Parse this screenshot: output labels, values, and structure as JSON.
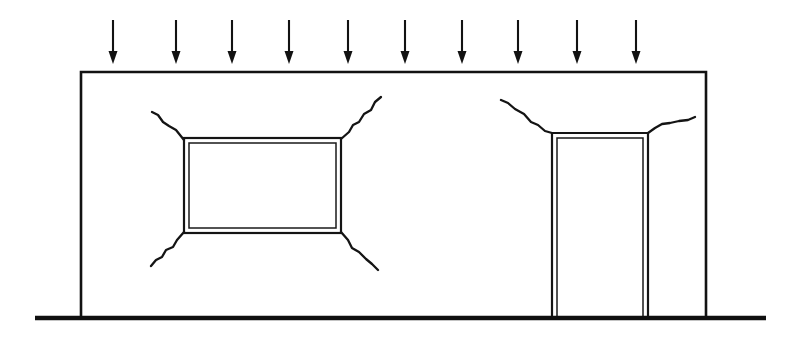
{
  "diagram": {
    "background_color": "#ffffff",
    "line_color": "#121212",
    "canvas": {
      "width": 797,
      "height": 338
    }
  },
  "wall": {
    "label": "Wall panel",
    "x_left": 81,
    "x_right": 706,
    "y_top": 72,
    "y_bottom": 318,
    "stroke_width": 2.6,
    "path": "M 81 318 L 81 72 L 706 72 L 706 318"
  },
  "ground": {
    "label": "Ground / support line",
    "x_start": 35,
    "x_end": 766,
    "y": 318,
    "stroke_width": 4.6
  },
  "load": {
    "label": "Uniform vertical load",
    "arrow_count": 10,
    "arrow_color": "#121212",
    "y_tail": 20,
    "y_tip": 64,
    "head_width": 9,
    "head_length": 13,
    "x_positions": [
      113,
      176,
      232,
      289,
      348,
      405,
      462,
      518,
      577,
      636
    ]
  },
  "openings": [
    {
      "name": "window-opening",
      "label": "Window opening",
      "type": "window",
      "outer": {
        "x": 184,
        "y": 138,
        "width": 157,
        "height": 95
      },
      "inner_inset": 5
    },
    {
      "name": "door-opening",
      "label": "Door opening",
      "type": "door",
      "outer": {
        "x": 552,
        "y": 133,
        "width": 96,
        "height": 185
      },
      "inner_inset": 5,
      "open_bottom": true
    }
  ],
  "cracks": [
    {
      "name": "crack-window-top-left",
      "label": "Diagonal crack - window top-left corner",
      "origin_corner": "top-left",
      "opening": "window-opening",
      "path": "M 184 140 L 176 130 L 169 126 L 163 122 L 158 115 L 152 112"
    },
    {
      "name": "crack-window-top-right",
      "label": "Diagonal crack - window top-right corner",
      "origin_corner": "top-right",
      "opening": "window-opening",
      "path": "M 341 139 L 349 132 L 353 125 L 359 122 L 364 114 L 371 110 L 375 102 L 381 97"
    },
    {
      "name": "crack-window-bottom-left",
      "label": "Diagonal crack - window bottom-left corner",
      "origin_corner": "bottom-left",
      "opening": "window-opening",
      "path": "M 184 232 L 177 240 L 173 247 L 166 250 L 162 257 L 156 260 L 151 266"
    },
    {
      "name": "crack-window-bottom-right",
      "label": "Diagonal crack - window bottom-right corner",
      "origin_corner": "bottom-right",
      "opening": "window-opening",
      "path": "M 341 232 L 348 240 L 352 248 L 359 252 L 366 259 L 372 264 L 378 270"
    },
    {
      "name": "crack-door-top-left",
      "label": "Crack - door top-left corner",
      "origin_corner": "top-left",
      "opening": "door-opening",
      "path": "M 552 133 L 545 131 L 538 125 L 531 122 L 524 114 L 515 109 L 508 103 L 501 100"
    },
    {
      "name": "crack-door-top-right",
      "label": "Crack - door top-right corner",
      "origin_corner": "top-right",
      "opening": "door-opening",
      "path": "M 648 133 L 655 128 L 662 124 L 670 123 L 679 121 L 688 120 L 695 117"
    }
  ]
}
